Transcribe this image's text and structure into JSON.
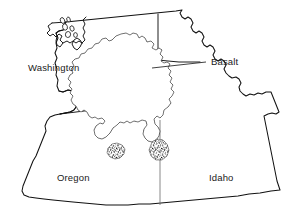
{
  "map": {
    "title": "Columbia River Basalt Region",
    "background_color": "#ffffff",
    "line_color": "#111111",
    "label_color": "#1a1a1a",
    "border_color_internal": "#6b6b6b",
    "stipple_color": "#1a1a1a",
    "labels": {
      "washington": "Washington",
      "oregon": "Oregon",
      "idaho": "Idaho",
      "basalt": "Basalt"
    },
    "label_positions": {
      "washington": {
        "x": 28,
        "y": 71
      },
      "oregon": {
        "x": 57,
        "y": 181
      },
      "idaho": {
        "x": 209,
        "y": 181
      },
      "basalt": {
        "x": 211,
        "y": 65
      }
    },
    "features": [
      {
        "name": "basalt-extent",
        "label": "Basalt",
        "type": "stippled-region",
        "description": "Columbia River Basalt Group flood basalt extent"
      },
      {
        "name": "state-washington",
        "label": "Washington",
        "type": "state"
      },
      {
        "name": "state-oregon",
        "label": "Oregon",
        "type": "state"
      },
      {
        "name": "state-idaho",
        "label": "Idaho",
        "type": "state"
      }
    ],
    "leader_line": {
      "from": {
        "x": 152,
        "y": 68
      },
      "to": {
        "x": 206,
        "y": 62
      }
    }
  }
}
